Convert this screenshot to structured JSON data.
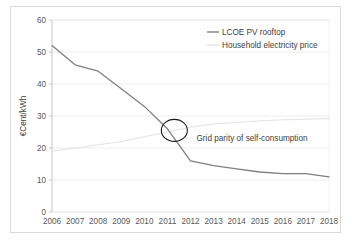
{
  "chart_data": {
    "type": "line",
    "title": "",
    "xlabel": "",
    "ylabel": "€Cent/kWh",
    "xlim": [
      2006,
      2018
    ],
    "ylim": [
      0,
      60
    ],
    "ytick_step": 10,
    "grid": "horizontal",
    "legend_position": "top-right",
    "categories": [
      2006,
      2007,
      2008,
      2009,
      2010,
      2011,
      2012,
      2013,
      2014,
      2015,
      2016,
      2017,
      2018
    ],
    "xtick_labels": [
      "2006",
      "2007",
      "2008",
      "2009",
      "2010",
      "2011",
      "2012",
      "2013",
      "2014",
      "2015",
      "2016",
      "2017",
      "2018"
    ],
    "ytick_labels": [
      "0",
      "10",
      "20",
      "30",
      "40",
      "50",
      "60"
    ],
    "ytick_values": [
      0,
      10,
      20,
      30,
      40,
      50,
      60
    ],
    "series": [
      {
        "name": "LCOE PV rooftop",
        "color": "#7f7f7f",
        "width": 1.3,
        "values": [
          52.0,
          46.0,
          44.0,
          38.5,
          33.0,
          26.0,
          16.0,
          14.5,
          13.5,
          12.5,
          12.0,
          12.0,
          11.0
        ]
      },
      {
        "name": "Household electricity price",
        "color": "#e2e2e2",
        "width": 1.0,
        "values": [
          19.0,
          20.0,
          21.0,
          22.0,
          23.5,
          25.0,
          26.5,
          27.5,
          28.0,
          28.5,
          28.8,
          29.0,
          29.2
        ]
      }
    ],
    "annotations": [
      {
        "name": "grid-parity",
        "text": "Grid parity of self-consumption",
        "marker": "ellipse",
        "x": 2011.3,
        "y": 25.5,
        "label_x": 2012.0,
        "label_y": 23.0
      }
    ]
  },
  "legend": {
    "items": [
      {
        "label": "LCOE PV rooftop",
        "color": "#7f7f7f"
      },
      {
        "label": "Household electricity price",
        "color": "#e2e2e2"
      }
    ]
  },
  "axes": {
    "y_title": "€Cent/kWh"
  }
}
